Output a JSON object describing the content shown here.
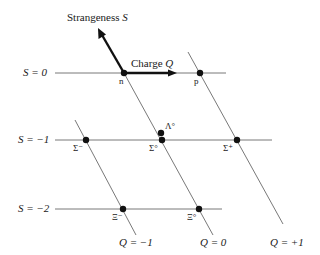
{
  "diagram": {
    "axes": {
      "strangeness_label": "Strangeness",
      "strangeness_symbol": "S",
      "charge_label": "Charge",
      "charge_symbol": "Q"
    },
    "strangeness_rows": [
      {
        "label": "S = 0",
        "value": 0
      },
      {
        "label": "S = −1",
        "value": -1
      },
      {
        "label": "S = −2",
        "value": -2
      }
    ],
    "charge_lines": [
      {
        "label": "Q = −1",
        "value": -1
      },
      {
        "label": "Q = 0",
        "value": 0
      },
      {
        "label": "Q = +1",
        "value": 1
      }
    ],
    "particles": [
      {
        "name": "n",
        "S": 0,
        "Q": 0
      },
      {
        "name": "p",
        "S": 0,
        "Q": 1
      },
      {
        "name": "Σ⁻",
        "S": -1,
        "Q": -1
      },
      {
        "name": "Σ°",
        "S": -1,
        "Q": 0
      },
      {
        "name": "Λ°",
        "S": -1,
        "Q": 0
      },
      {
        "name": "Σ⁺",
        "S": -1,
        "Q": 1
      },
      {
        "name": "Ξ⁻",
        "S": -2,
        "Q": -1
      },
      {
        "name": "Ξ°",
        "S": -2,
        "Q": 0
      }
    ],
    "colors": {
      "ink": "#1a1a1a",
      "line": "#555555",
      "background": "#ffffff"
    }
  }
}
